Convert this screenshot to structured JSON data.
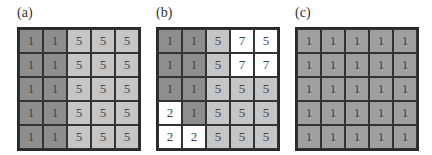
{
  "colors": {
    "dark": "#8e8e8e",
    "light": "#c6c6c6",
    "white": "#ffffff",
    "mid": "#9f9f9f",
    "border": "#2a2a2a"
  },
  "panels": [
    {
      "label": "(a)",
      "cells": [
        [
          {
            "v": "1",
            "c": "dark"
          },
          {
            "v": "1",
            "c": "dark"
          },
          {
            "v": "5",
            "c": "light"
          },
          {
            "v": "5",
            "c": "light"
          },
          {
            "v": "5",
            "c": "light"
          }
        ],
        [
          {
            "v": "1",
            "c": "dark"
          },
          {
            "v": "1",
            "c": "dark"
          },
          {
            "v": "5",
            "c": "light"
          },
          {
            "v": "5",
            "c": "light"
          },
          {
            "v": "5",
            "c": "light"
          }
        ],
        [
          {
            "v": "1",
            "c": "dark"
          },
          {
            "v": "1",
            "c": "dark"
          },
          {
            "v": "5",
            "c": "light"
          },
          {
            "v": "5",
            "c": "light"
          },
          {
            "v": "5",
            "c": "light"
          }
        ],
        [
          {
            "v": "1",
            "c": "dark"
          },
          {
            "v": "1",
            "c": "dark"
          },
          {
            "v": "5",
            "c": "light"
          },
          {
            "v": "5",
            "c": "light"
          },
          {
            "v": "5",
            "c": "light"
          }
        ],
        [
          {
            "v": "1",
            "c": "dark"
          },
          {
            "v": "1",
            "c": "dark"
          },
          {
            "v": "5",
            "c": "light"
          },
          {
            "v": "5",
            "c": "light"
          },
          {
            "v": "5",
            "c": "light"
          }
        ]
      ]
    },
    {
      "label": "(b)",
      "cells": [
        [
          {
            "v": "1",
            "c": "dark"
          },
          {
            "v": "1",
            "c": "dark"
          },
          {
            "v": "5",
            "c": "light"
          },
          {
            "v": "7",
            "c": "white"
          },
          {
            "v": "5",
            "c": "white"
          }
        ],
        [
          {
            "v": "1",
            "c": "dark"
          },
          {
            "v": "1",
            "c": "dark"
          },
          {
            "v": "5",
            "c": "light"
          },
          {
            "v": "7",
            "c": "white"
          },
          {
            "v": "7",
            "c": "white"
          }
        ],
        [
          {
            "v": "1",
            "c": "dark"
          },
          {
            "v": "1",
            "c": "dark"
          },
          {
            "v": "5",
            "c": "light"
          },
          {
            "v": "5",
            "c": "light"
          },
          {
            "v": "5",
            "c": "light"
          }
        ],
        [
          {
            "v": "2",
            "c": "white"
          },
          {
            "v": "1",
            "c": "dark"
          },
          {
            "v": "5",
            "c": "light"
          },
          {
            "v": "5",
            "c": "light"
          },
          {
            "v": "5",
            "c": "light"
          }
        ],
        [
          {
            "v": "2",
            "c": "white"
          },
          {
            "v": "2",
            "c": "white"
          },
          {
            "v": "5",
            "c": "light"
          },
          {
            "v": "5",
            "c": "light"
          },
          {
            "v": "5",
            "c": "light"
          }
        ]
      ]
    },
    {
      "label": "(c)",
      "cells": [
        [
          {
            "v": "1",
            "c": "mid"
          },
          {
            "v": "1",
            "c": "mid"
          },
          {
            "v": "1",
            "c": "mid"
          },
          {
            "v": "1",
            "c": "mid"
          },
          {
            "v": "1",
            "c": "mid"
          }
        ],
        [
          {
            "v": "1",
            "c": "mid"
          },
          {
            "v": "1",
            "c": "mid"
          },
          {
            "v": "1",
            "c": "mid"
          },
          {
            "v": "1",
            "c": "mid"
          },
          {
            "v": "1",
            "c": "mid"
          }
        ],
        [
          {
            "v": "1",
            "c": "mid"
          },
          {
            "v": "1",
            "c": "mid"
          },
          {
            "v": "1",
            "c": "mid"
          },
          {
            "v": "1",
            "c": "mid"
          },
          {
            "v": "1",
            "c": "mid"
          }
        ],
        [
          {
            "v": "1",
            "c": "mid"
          },
          {
            "v": "1",
            "c": "mid"
          },
          {
            "v": "1",
            "c": "mid"
          },
          {
            "v": "1",
            "c": "mid"
          },
          {
            "v": "1",
            "c": "mid"
          }
        ],
        [
          {
            "v": "1",
            "c": "mid"
          },
          {
            "v": "1",
            "c": "mid"
          },
          {
            "v": "1",
            "c": "mid"
          },
          {
            "v": "1",
            "c": "mid"
          },
          {
            "v": "1",
            "c": "mid"
          }
        ]
      ]
    }
  ]
}
